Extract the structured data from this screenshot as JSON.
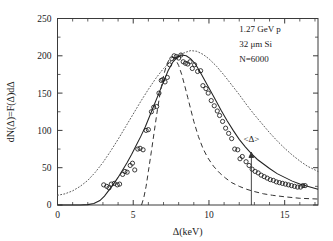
{
  "chart_data": {
    "type": "scatter",
    "title": "",
    "xlabel": "Δ(keV)",
    "ylabel": "dN(Δ)=F(Δ)dΔ",
    "xlim": [
      0,
      17.2
    ],
    "ylim": [
      0,
      250
    ],
    "xticks": [
      0,
      5,
      10,
      15
    ],
    "yticks": [
      0,
      50,
      100,
      150,
      200,
      250
    ],
    "xticklabels": [
      "0",
      "5",
      "10",
      "15"
    ],
    "yticklabels": [
      "0",
      "50",
      "100",
      "150",
      "200",
      "250"
    ],
    "grid": false,
    "legend": "none",
    "annotations": [
      {
        "name": "beam-energy",
        "text": "1.27 GeV p",
        "x": 12.0,
        "y": 232
      },
      {
        "name": "absorber",
        "text": "32 μm Si",
        "x": 12.0,
        "y": 212
      },
      {
        "name": "event-count",
        "text": "N=6000",
        "x": 12.0,
        "y": 192
      },
      {
        "name": "mean-marker-label",
        "text": "<Δ>",
        "x": 12.8,
        "y": 84
      }
    ],
    "mean_marker": {
      "label": "<Δ>",
      "x": 12.8,
      "y_top": 70,
      "y_bottom": 0
    },
    "series": [
      {
        "name": "simulated-data",
        "style": "open-circles",
        "points": [
          [
            3.05,
            27
          ],
          [
            3.25,
            25
          ],
          [
            3.4,
            23
          ],
          [
            3.55,
            28
          ],
          [
            3.75,
            29
          ],
          [
            3.95,
            27
          ],
          [
            4.1,
            28
          ],
          [
            4.3,
            41
          ],
          [
            4.45,
            45
          ],
          [
            4.6,
            44
          ],
          [
            4.8,
            53
          ],
          [
            4.95,
            56
          ],
          [
            5.1,
            47
          ],
          [
            5.3,
            75
          ],
          [
            5.45,
            76
          ],
          [
            5.65,
            74
          ],
          [
            5.85,
            100
          ],
          [
            6.0,
            101
          ],
          [
            6.2,
            125
          ],
          [
            6.35,
            131
          ],
          [
            6.55,
            132
          ],
          [
            6.7,
            150
          ],
          [
            6.85,
            167
          ],
          [
            6.95,
            168
          ],
          [
            7.1,
            165
          ],
          [
            7.25,
            171
          ],
          [
            7.4,
            188
          ],
          [
            7.55,
            196
          ],
          [
            7.7,
            200
          ],
          [
            7.85,
            199
          ],
          [
            8.0,
            197
          ],
          [
            8.15,
            201
          ],
          [
            8.3,
            192
          ],
          [
            8.45,
            190
          ],
          [
            8.6,
            189
          ],
          [
            8.75,
            192
          ],
          [
            8.9,
            183
          ],
          [
            9.05,
            188
          ],
          [
            9.25,
            179
          ],
          [
            9.45,
            180
          ],
          [
            9.6,
            160
          ],
          [
            9.8,
            156
          ],
          [
            9.95,
            150
          ],
          [
            10.15,
            140
          ],
          [
            10.35,
            133
          ],
          [
            10.55,
            126
          ],
          [
            10.7,
            120
          ],
          [
            10.9,
            112
          ],
          [
            11.1,
            103
          ],
          [
            11.3,
            96
          ],
          [
            11.5,
            89
          ],
          [
            11.7,
            75
          ],
          [
            11.9,
            74
          ],
          [
            12.05,
            62
          ],
          [
            12.2,
            65
          ],
          [
            12.45,
            58
          ],
          [
            12.65,
            53
          ],
          [
            12.85,
            48
          ],
          [
            13.05,
            45
          ],
          [
            13.25,
            43
          ],
          [
            13.45,
            40
          ],
          [
            13.65,
            38
          ],
          [
            13.85,
            36
          ],
          [
            14.05,
            34
          ],
          [
            14.25,
            33
          ],
          [
            14.45,
            31
          ],
          [
            14.65,
            30
          ],
          [
            14.85,
            29
          ],
          [
            15.05,
            28
          ],
          [
            15.25,
            27
          ],
          [
            15.45,
            26
          ],
          [
            15.65,
            25
          ],
          [
            15.85,
            24
          ],
          [
            16.05,
            24
          ],
          [
            16.2,
            26
          ],
          [
            16.35,
            26
          ]
        ]
      }
    ],
    "curves": [
      {
        "name": "convolved-straggling-solid",
        "style": "solid",
        "points": [
          [
            0.0,
            0
          ],
          [
            1.5,
            0
          ],
          [
            2.0,
            0.5
          ],
          [
            2.4,
            2
          ],
          [
            2.8,
            6
          ],
          [
            3.1,
            12
          ],
          [
            3.4,
            20
          ],
          [
            3.7,
            28
          ],
          [
            4.0,
            37
          ],
          [
            4.3,
            47
          ],
          [
            4.6,
            57
          ],
          [
            4.9,
            68
          ],
          [
            5.2,
            80
          ],
          [
            5.5,
            92
          ],
          [
            5.8,
            105
          ],
          [
            6.1,
            120
          ],
          [
            6.4,
            135
          ],
          [
            6.7,
            150
          ],
          [
            7.0,
            165
          ],
          [
            7.3,
            180
          ],
          [
            7.6,
            191
          ],
          [
            7.9,
            198
          ],
          [
            8.2,
            201
          ],
          [
            8.5,
            200
          ],
          [
            8.8,
            196
          ],
          [
            9.1,
            189
          ],
          [
            9.4,
            179
          ],
          [
            9.7,
            168
          ],
          [
            10.0,
            157
          ],
          [
            10.4,
            142
          ],
          [
            10.8,
            127
          ],
          [
            11.2,
            113
          ],
          [
            11.6,
            100
          ],
          [
            12.0,
            88
          ],
          [
            12.4,
            78
          ],
          [
            12.8,
            69
          ],
          [
            13.2,
            61
          ],
          [
            13.6,
            55
          ],
          [
            14.0,
            49
          ],
          [
            14.5,
            42
          ],
          [
            15.0,
            37
          ],
          [
            15.5,
            32
          ],
          [
            16.0,
            28
          ],
          [
            16.5,
            25
          ],
          [
            17.2,
            21
          ]
        ]
      },
      {
        "name": "landau-dotted",
        "style": "dotted",
        "points": [
          [
            0.0,
            13
          ],
          [
            0.5,
            15
          ],
          [
            1.0,
            19
          ],
          [
            1.5,
            25
          ],
          [
            2.0,
            33
          ],
          [
            2.5,
            44
          ],
          [
            3.0,
            57
          ],
          [
            3.5,
            72
          ],
          [
            4.0,
            88
          ],
          [
            4.5,
            105
          ],
          [
            5.0,
            122
          ],
          [
            5.5,
            139
          ],
          [
            6.0,
            155
          ],
          [
            6.5,
            170
          ],
          [
            7.0,
            183
          ],
          [
            7.5,
            193
          ],
          [
            8.0,
            201
          ],
          [
            8.5,
            205
          ],
          [
            8.8,
            207
          ],
          [
            9.2,
            206
          ],
          [
            9.6,
            202
          ],
          [
            10.0,
            196
          ],
          [
            10.5,
            186
          ],
          [
            11.0,
            174
          ],
          [
            11.5,
            161
          ],
          [
            12.0,
            148
          ],
          [
            12.5,
            134
          ],
          [
            13.0,
            121
          ],
          [
            13.5,
            109
          ],
          [
            14.0,
            97
          ],
          [
            14.5,
            86
          ],
          [
            15.0,
            76
          ],
          [
            15.5,
            67
          ],
          [
            16.0,
            59
          ],
          [
            16.5,
            52
          ],
          [
            17.2,
            45
          ]
        ]
      },
      {
        "name": "gaussian-dashed",
        "style": "dashed",
        "points": [
          [
            5.55,
            0
          ],
          [
            5.7,
            10
          ],
          [
            5.85,
            25
          ],
          [
            6.0,
            45
          ],
          [
            6.2,
            72
          ],
          [
            6.4,
            100
          ],
          [
            6.6,
            128
          ],
          [
            6.8,
            153
          ],
          [
            7.0,
            173
          ],
          [
            7.2,
            188
          ],
          [
            7.4,
            196
          ],
          [
            7.6,
            198
          ],
          [
            7.8,
            195
          ],
          [
            8.0,
            187
          ],
          [
            8.2,
            175
          ],
          [
            8.4,
            160
          ],
          [
            8.6,
            144
          ],
          [
            8.8,
            128
          ],
          [
            9.0,
            112
          ],
          [
            9.3,
            92
          ],
          [
            9.6,
            76
          ],
          [
            9.9,
            64
          ],
          [
            10.3,
            52
          ],
          [
            10.7,
            43
          ],
          [
            11.1,
            36
          ],
          [
            11.5,
            30
          ],
          [
            12.0,
            25
          ],
          [
            12.5,
            21
          ],
          [
            13.0,
            18
          ],
          [
            13.6,
            15
          ],
          [
            14.2,
            13
          ],
          [
            15.0,
            11
          ],
          [
            16.0,
            9
          ],
          [
            17.2,
            8
          ]
        ]
      }
    ]
  }
}
